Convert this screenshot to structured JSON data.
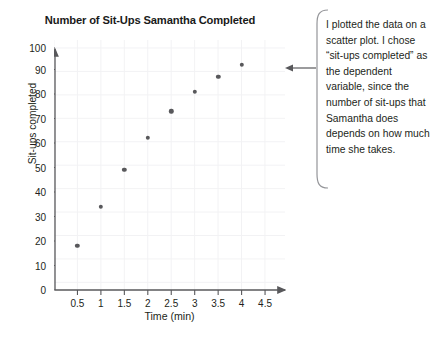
{
  "chart_data": {
    "type": "scatter",
    "title": "Number of Sit-Ups Samantha Completed",
    "xlabel": "Time (min)",
    "ylabel": "Sit-ups completed",
    "xlim": [
      0,
      4.75
    ],
    "ylim": [
      0,
      102
    ],
    "grid": true,
    "legend": "none",
    "x_ticks": [
      "0.5",
      "1",
      "1.5",
      "2",
      "2.5",
      "3",
      "3.5",
      "4",
      "4.5"
    ],
    "x_tick_values": [
      0.5,
      1,
      1.5,
      2,
      2.5,
      3,
      3.5,
      4,
      4.5
    ],
    "y_ticks": [
      "0",
      "10",
      "20",
      "30",
      "40",
      "50",
      "60",
      "70",
      "80",
      "90",
      "100"
    ],
    "y_tick_values": [
      0,
      10,
      20,
      30,
      40,
      50,
      60,
      70,
      80,
      90,
      100
    ],
    "x": [
      0.5,
      1,
      1.5,
      2,
      2.5,
      3,
      3.5,
      4
    ],
    "y": [
      18,
      34,
      49,
      62,
      73,
      81,
      87,
      92
    ],
    "points": [
      {
        "x": 0.5,
        "y": 18
      },
      {
        "x": 1,
        "y": 34
      },
      {
        "x": 1.5,
        "y": 49
      },
      {
        "x": 2,
        "y": 62
      },
      {
        "x": 2.5,
        "y": 73
      },
      {
        "x": 3,
        "y": 81
      },
      {
        "x": 3.5,
        "y": 87
      },
      {
        "x": 4,
        "y": 92
      }
    ],
    "marker_color": "#58585b",
    "axis_color": "#58585b",
    "grid_color": "#f2f2f4"
  },
  "callout": {
    "text": "I plotted the data on a scatter plot. I chose “sit-ups completed” as the dependent variable, since the number of sit-ups that Samantha does depends on how much time she takes."
  }
}
